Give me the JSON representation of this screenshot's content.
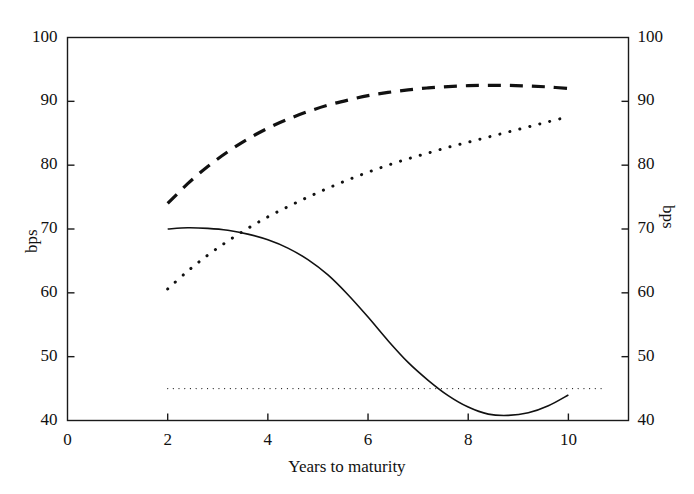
{
  "chart_data": {
    "type": "line",
    "title": "",
    "xlabel": "Years to maturity",
    "ylabel": "bps",
    "ylabel_right": "bps",
    "xlim": [
      0,
      11.2
    ],
    "ylim": [
      40,
      100
    ],
    "xticks": [
      0,
      2,
      4,
      6,
      8,
      10
    ],
    "yticks": [
      40,
      50,
      60,
      70,
      80,
      90,
      100
    ],
    "xticklabels": [
      "0",
      "2",
      "4",
      "6",
      "8",
      "10"
    ],
    "yticklabels": [
      "40",
      "50",
      "60",
      "70",
      "80",
      "90",
      "100"
    ],
    "yticklabels_right": [
      "40",
      "50",
      "60",
      "70",
      "80",
      "90",
      "100"
    ],
    "grid": false,
    "legend": "none",
    "series": [
      {
        "name": "dashed-upper-curve",
        "style": "dashed",
        "linewidth": 3.2,
        "x": [
          2.0,
          2.4,
          2.8,
          3.2,
          3.6,
          4.0,
          4.4,
          4.8,
          5.2,
          5.6,
          6.0,
          6.4,
          6.8,
          7.2,
          7.6,
          8.0,
          8.4,
          8.8,
          9.2,
          9.6,
          10.0
        ],
        "values": [
          74.0,
          77.1,
          79.8,
          82.1,
          84.1,
          85.8,
          87.2,
          88.4,
          89.4,
          90.2,
          90.9,
          91.4,
          91.8,
          92.1,
          92.3,
          92.45,
          92.5,
          92.5,
          92.4,
          92.25,
          92.0
        ]
      },
      {
        "name": "dotted-middle-curve",
        "style": "dotted",
        "linewidth": 3.0,
        "x": [
          2.0,
          2.4,
          2.8,
          3.2,
          3.6,
          4.0,
          4.4,
          4.8,
          5.2,
          5.6,
          6.0,
          6.4,
          6.8,
          7.2,
          7.6,
          8.0,
          8.4,
          8.8,
          9.2,
          9.6,
          10.0
        ],
        "values": [
          60.6,
          63.4,
          65.9,
          68.1,
          70.1,
          71.9,
          73.5,
          75.0,
          76.4,
          77.7,
          78.9,
          80.0,
          81.0,
          81.9,
          82.8,
          83.6,
          84.4,
          85.2,
          86.0,
          86.8,
          87.6
        ]
      },
      {
        "name": "solid-lower-curve",
        "style": "solid",
        "linewidth": 1.6,
        "x": [
          2.0,
          2.4,
          2.8,
          3.2,
          3.6,
          4.0,
          4.4,
          4.8,
          5.2,
          5.6,
          6.0,
          6.4,
          6.8,
          7.2,
          7.6,
          8.0,
          8.4,
          8.8,
          9.2,
          9.6,
          10.0
        ],
        "values": [
          70.0,
          70.2,
          70.1,
          69.8,
          69.2,
          68.3,
          67.0,
          65.2,
          62.8,
          59.7,
          56.2,
          52.5,
          49.1,
          46.3,
          43.9,
          42.1,
          41.0,
          40.8,
          41.2,
          42.3,
          44.0
        ]
      },
      {
        "name": "fine-dotted-reference-line",
        "style": "fine-dotted",
        "linewidth": 1.1,
        "x": [
          2.0,
          10.7
        ],
        "values": [
          45.0,
          45.0
        ]
      }
    ]
  }
}
